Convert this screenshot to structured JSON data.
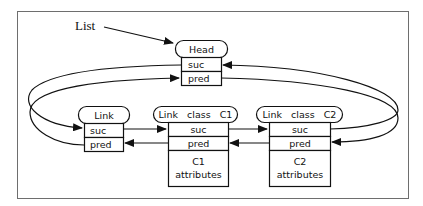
{
  "diagram": {
    "title_label": "List",
    "nodes": {
      "head": {
        "title": "Head",
        "fields": [
          "suc",
          "pred"
        ]
      },
      "link": {
        "title": "Link",
        "fields": [
          "suc",
          "pred"
        ]
      },
      "c1": {
        "title": "Link   class   C1",
        "fields": [
          "suc",
          "pred"
        ],
        "body_line1": "C1",
        "body_line2": "attributes"
      },
      "c2": {
        "title": "Link   class   C2",
        "fields": [
          "suc",
          "pred"
        ],
        "body_line1": "C2",
        "body_line2": "attributes"
      }
    },
    "edges": [
      {
        "from": "List",
        "to": "Head"
      },
      {
        "from": "Head.suc",
        "to": "Link.suc"
      },
      {
        "from": "Link.pred",
        "to": "Head.pred"
      },
      {
        "from": "Link.suc",
        "to": "C1.suc"
      },
      {
        "from": "C1.suc",
        "to": "C2.suc"
      },
      {
        "from": "C1.pred",
        "to": "Link.pred"
      },
      {
        "from": "C2.pred",
        "to": "C1.pred"
      },
      {
        "from": "C2.suc",
        "to": "Head.suc"
      },
      {
        "from": "Head.pred",
        "to": "C2.pred"
      }
    ]
  }
}
